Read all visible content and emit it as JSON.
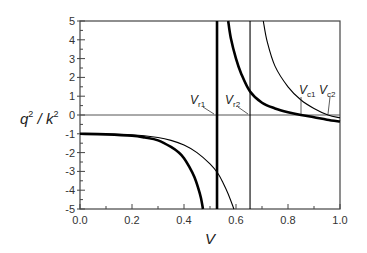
{
  "chart_data": {
    "type": "line",
    "title": "",
    "xlabel": "V",
    "ylabel": "q^2 / k^2",
    "xlim": [
      0.0,
      1.0
    ],
    "ylim": [
      -5,
      5
    ],
    "grid": false,
    "legend": null,
    "x_ticks": [
      "0.0",
      "0.2",
      "0.4",
      "0.6",
      "0.8",
      "1.0"
    ],
    "y_ticks": [
      "5",
      "4",
      "3",
      "2",
      "1",
      "0",
      "-1",
      "-2",
      "-3",
      "-4",
      "-5"
    ],
    "series": [
      {
        "name": "thick curve (left branch)",
        "style": "thick",
        "points": [
          [
            0.0,
            -1.0
          ],
          [
            0.1,
            -1.03
          ],
          [
            0.2,
            -1.1
          ],
          [
            0.25,
            -1.2
          ],
          [
            0.3,
            -1.35
          ],
          [
            0.35,
            -1.7
          ],
          [
            0.38,
            -2.0
          ],
          [
            0.4,
            -2.3
          ],
          [
            0.42,
            -2.75
          ],
          [
            0.44,
            -3.3
          ],
          [
            0.455,
            -3.9
          ],
          [
            0.465,
            -4.4
          ],
          [
            0.473,
            -5.0
          ]
        ]
      },
      {
        "name": "thick curve (right branch)",
        "style": "thick",
        "points": [
          [
            0.57,
            5.0
          ],
          [
            0.58,
            4.1
          ],
          [
            0.6,
            3.0
          ],
          [
            0.62,
            2.2
          ],
          [
            0.654,
            1.25
          ],
          [
            0.7,
            0.65
          ],
          [
            0.75,
            0.35
          ],
          [
            0.8,
            0.15
          ],
          [
            0.85,
            0.0
          ],
          [
            0.9,
            -0.12
          ],
          [
            0.95,
            -0.25
          ],
          [
            1.0,
            -0.35
          ]
        ]
      },
      {
        "name": "thin curve (left branch)",
        "style": "thin",
        "points": [
          [
            0.0,
            -1.0
          ],
          [
            0.1,
            -1.02
          ],
          [
            0.2,
            -1.05
          ],
          [
            0.3,
            -1.2
          ],
          [
            0.35,
            -1.35
          ],
          [
            0.4,
            -1.6
          ],
          [
            0.45,
            -2.0
          ],
          [
            0.5,
            -2.6
          ],
          [
            0.53,
            -3.1
          ],
          [
            0.55,
            -3.6
          ],
          [
            0.57,
            -4.2
          ],
          [
            0.592,
            -5.0
          ]
        ]
      },
      {
        "name": "thin curve (right branch)",
        "style": "thin",
        "points": [
          [
            0.705,
            5.0
          ],
          [
            0.72,
            3.9
          ],
          [
            0.75,
            2.6
          ],
          [
            0.8,
            1.5
          ],
          [
            0.85,
            0.8
          ],
          [
            0.9,
            0.35
          ],
          [
            0.954,
            0.0
          ],
          [
            1.0,
            -0.15
          ]
        ]
      },
      {
        "name": "thick vertical asymptote",
        "style": "thick-vertical",
        "x": 0.527
      },
      {
        "name": "thin vertical asymptote",
        "style": "thin-vertical",
        "x": 0.654
      }
    ],
    "annotations": [
      {
        "label": "V",
        "sub": "r1",
        "x": 0.527,
        "y": 0
      },
      {
        "label": "V",
        "sub": "r2",
        "x": 0.654,
        "y": 0
      },
      {
        "label": "V",
        "sub": "c1",
        "x": 0.85,
        "y": 0
      },
      {
        "label": "V",
        "sub": "c2",
        "x": 0.954,
        "y": 0
      }
    ],
    "reference_lines": [
      {
        "y": 0
      }
    ]
  },
  "axis": {
    "x_title": "V",
    "y_title_base_q": "q",
    "y_title_sep": " / ",
    "y_title_base_k": "k",
    "y_title_exp": "2"
  },
  "annot": {
    "r1": {
      "main": "V",
      "sub": "r1"
    },
    "r2": {
      "main": "V",
      "sub": "r2"
    },
    "c1": {
      "main": "V",
      "sub": "c1"
    },
    "c2": {
      "main": "V",
      "sub": "c2"
    }
  }
}
